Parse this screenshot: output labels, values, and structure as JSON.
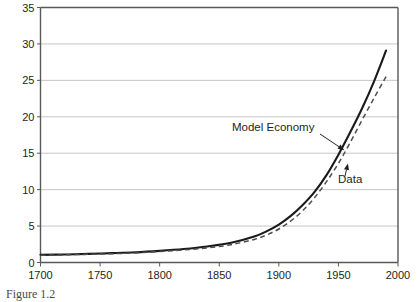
{
  "caption": "Figure 1.2",
  "chart_data": {
    "type": "line",
    "title": "",
    "xlabel": "",
    "ylabel": "",
    "xlim": [
      1700,
      2000
    ],
    "ylim": [
      0,
      35
    ],
    "xticks": [
      1700,
      1750,
      1800,
      1850,
      1900,
      1950,
      2000
    ],
    "yticks": [
      0,
      5,
      10,
      15,
      20,
      25,
      30,
      35
    ],
    "grid": true,
    "legend_position": "inline-annotations",
    "annotations": [
      {
        "name": "model-economy",
        "text": "Model Economy",
        "points_to_series": "Model Economy",
        "points_to_x": 1955,
        "points_to_y": 15.4
      },
      {
        "name": "data",
        "text": "Data",
        "points_to_series": "Data",
        "points_to_x": 1958,
        "points_to_y": 13.6
      }
    ],
    "series": [
      {
        "name": "Model Economy",
        "style": "solid",
        "color": "#1a1a1a",
        "x": [
          1700,
          1720,
          1740,
          1760,
          1780,
          1800,
          1820,
          1840,
          1860,
          1880,
          1890,
          1900,
          1910,
          1920,
          1930,
          1940,
          1950,
          1960,
          1970,
          1980,
          1990
        ],
        "y": [
          1.05,
          1.1,
          1.18,
          1.28,
          1.4,
          1.6,
          1.85,
          2.2,
          2.7,
          3.6,
          4.3,
          5.2,
          6.4,
          7.9,
          9.7,
          12.0,
          14.8,
          17.9,
          21.2,
          24.9,
          29.1
        ]
      },
      {
        "name": "Data",
        "style": "dashed",
        "color": "#4d4d4d",
        "x": [
          1700,
          1720,
          1740,
          1760,
          1780,
          1800,
          1820,
          1840,
          1860,
          1880,
          1890,
          1900,
          1910,
          1920,
          1930,
          1940,
          1950,
          1960,
          1970,
          1980,
          1990
        ],
        "y": [
          1.0,
          1.05,
          1.12,
          1.2,
          1.32,
          1.5,
          1.72,
          2.0,
          2.45,
          3.2,
          3.8,
          4.6,
          5.7,
          7.1,
          8.9,
          11.1,
          13.6,
          16.5,
          19.6,
          22.6,
          25.5
        ]
      }
    ]
  }
}
